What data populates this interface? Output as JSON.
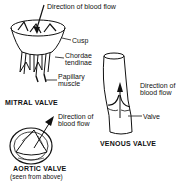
{
  "diagram": {
    "mitral_valve": {
      "title": "MITRAL VALVE",
      "labels": {
        "flow": "Direction of blood flow",
        "cusp": "Cusp",
        "chordae_1": "Chordae",
        "chordae_2": "tendinae",
        "papillary_1": "Papillary",
        "papillary_2": "muscle"
      }
    },
    "venous_valve": {
      "title": "VENOUS VALVE",
      "labels": {
        "flow_1": "Direction of",
        "flow_2": "blood flow",
        "valve": "Valve"
      }
    },
    "aortic_valve": {
      "title": "AORTIC VALVE",
      "subtitle": "(seen from above)",
      "labels": {
        "flow_1": "Direction of",
        "flow_2": "blood flow"
      }
    }
  }
}
